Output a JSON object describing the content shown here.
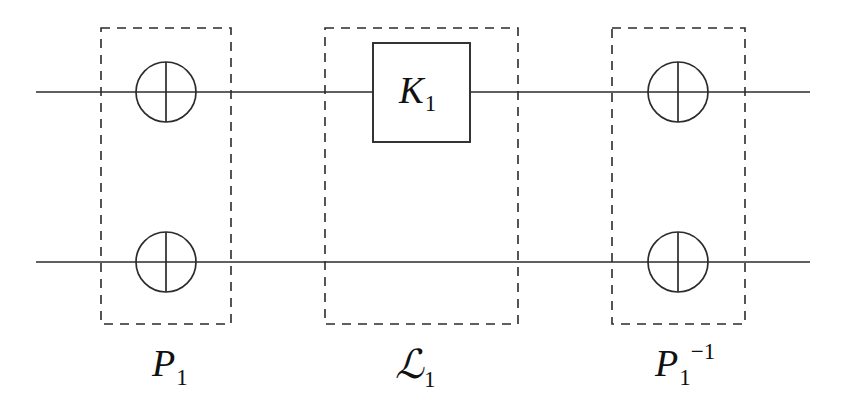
{
  "figure": {
    "kind": "quantum-circuit-diagram",
    "width": 847,
    "height": 412,
    "background_color": "#ffffff",
    "line_color": "#2b2b2b",
    "text_color": "#111111"
  },
  "wires": [
    {
      "name": "top-wire",
      "y": 92,
      "x_start": 36,
      "x_end": 810
    },
    {
      "name": "bottom-wire",
      "y": 262,
      "x_start": 36,
      "x_end": 810
    }
  ],
  "dashed_groups": [
    {
      "id": "group-p1",
      "label_text": "P",
      "label_subscript": "1",
      "label_superscript": "",
      "x": 101,
      "y": 28,
      "width": 130,
      "height": 296,
      "label_x": 152,
      "label_y": 344
    },
    {
      "id": "group-o1",
      "label_text": "ℒ",
      "label_subscript": "1",
      "label_superscript": "",
      "x": 325,
      "y": 28,
      "width": 193,
      "height": 296,
      "label_x": 395,
      "label_y": 344
    },
    {
      "id": "group-p1-inverse",
      "label_text": "P",
      "label_subscript": "1",
      "label_superscript": "−1",
      "x": 612,
      "y": 28,
      "width": 133,
      "height": 296,
      "label_x": 655,
      "label_y": 344
    }
  ],
  "circle_gates": [
    {
      "id": "gate-circle-top-left",
      "cx": 166,
      "cy": 92,
      "r": 30
    },
    {
      "id": "gate-circle-bottom-left",
      "cx": 166,
      "cy": 262,
      "r": 30
    },
    {
      "id": "gate-circle-top-right",
      "cx": 678,
      "cy": 92,
      "r": 30
    },
    {
      "id": "gate-circle-bottom-right",
      "cx": 678,
      "cy": 262,
      "r": 30
    }
  ],
  "box_gates": [
    {
      "id": "gate-box-k1",
      "label_text": "K",
      "label_subscript": "1",
      "x": 373,
      "y": 43,
      "width": 97,
      "height": 99,
      "text_x": 399,
      "text_y": 72
    }
  ],
  "labels": {
    "p1": "P",
    "p1_sub": "1",
    "o1": "ℒ",
    "o1_sub": "1",
    "p1_inv": "P",
    "p1_inv_sub": "1",
    "p1_inv_sup": "−1",
    "k1": "K",
    "k1_sub": "1"
  }
}
